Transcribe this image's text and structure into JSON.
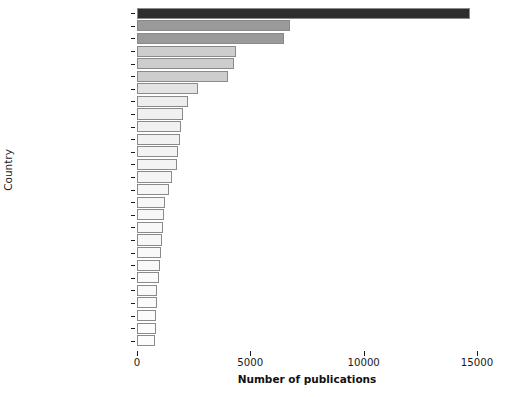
{
  "chart_data": {
    "type": "bar",
    "orientation": "horizontal",
    "title": "",
    "xlabel": "Number of publications",
    "ylabel": "Country",
    "xlim": [
      0,
      15000
    ],
    "xticks": [
      0,
      5000,
      10000,
      15000
    ],
    "xticklabels": [
      "0",
      "5000",
      "10000",
      "15000"
    ],
    "grid": false,
    "legend": "none",
    "categories": [
      "United States",
      "United Kingdom",
      "China",
      "Germany",
      "Australia",
      "Canada",
      "France",
      "Spain",
      "Netherlands",
      "Italy",
      "India",
      "Sweden",
      "Japan",
      "Switzerland",
      "Norway",
      "Brazil",
      "South Africa",
      "Russian Federation",
      "Denmark",
      "South Korea",
      "Austria",
      "Finland",
      "New Zealand",
      "Iran",
      "Portugal",
      "Mexico",
      "Belgium"
    ],
    "values": [
      14700,
      6750,
      6500,
      4350,
      4300,
      4000,
      2700,
      2250,
      2050,
      1950,
      1900,
      1800,
      1750,
      1550,
      1400,
      1250,
      1200,
      1150,
      1100,
      1050,
      1000,
      950,
      900,
      880,
      860,
      840,
      800
    ],
    "bar_colors": [
      "#2d2d2d",
      "#9a9a9a",
      "#9a9a9a",
      "#cdcdcd",
      "#cdcdcd",
      "#cdcdcd",
      "#e3e3e3",
      "#ededed",
      "#f0f0f0",
      "#f1f1f1",
      "#f2f2f2",
      "#f3f3f3",
      "#f4f4f4",
      "#f5f5f5",
      "#f6f6f6",
      "#f7f7f7",
      "#f7f7f7",
      "#f8f8f8",
      "#f8f8f8",
      "#f9f9f9",
      "#f9f9f9",
      "#fafafa",
      "#fafafa",
      "#fbfbfb",
      "#fbfbfb",
      "#fcfcfc",
      "#fcfcfc"
    ],
    "bar_edge_color": "#8a8a8a",
    "text_color": "#1a1a1a",
    "background": "#ffffff"
  }
}
